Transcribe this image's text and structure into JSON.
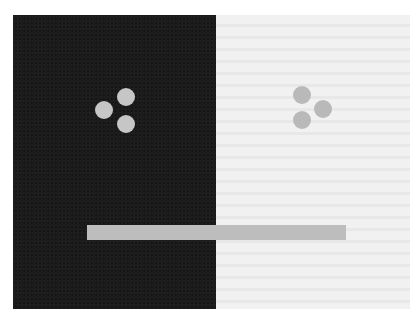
{
  "figure": {
    "type": "simultaneous-contrast-illusion",
    "colors": {
      "dark_panel": "#1c1c1c",
      "light_panel": "#f1f1f1",
      "circle_on_dark": "#c6c6c6",
      "circle_on_light": "#b9b9b9",
      "bar": "#bdbdbd",
      "page_background": "#ffffff"
    },
    "dark_panel": {
      "x": 13,
      "y": 15,
      "width": 203,
      "height": 294,
      "circles": [
        {
          "cx": 103.5,
          "cy": 110,
          "r": 9
        },
        {
          "cx": 126,
          "cy": 97,
          "r": 9
        },
        {
          "cx": 126,
          "cy": 124,
          "r": 9
        }
      ]
    },
    "light_panel": {
      "x": 216,
      "y": 15,
      "width": 194,
      "height": 294,
      "circles": [
        {
          "cx": 302,
          "cy": 95,
          "r": 9
        },
        {
          "cx": 323,
          "cy": 109,
          "r": 9
        },
        {
          "cx": 302,
          "cy": 120,
          "r": 9
        }
      ]
    },
    "bar": {
      "x": 87,
      "y": 225,
      "width": 259,
      "height": 15
    }
  }
}
